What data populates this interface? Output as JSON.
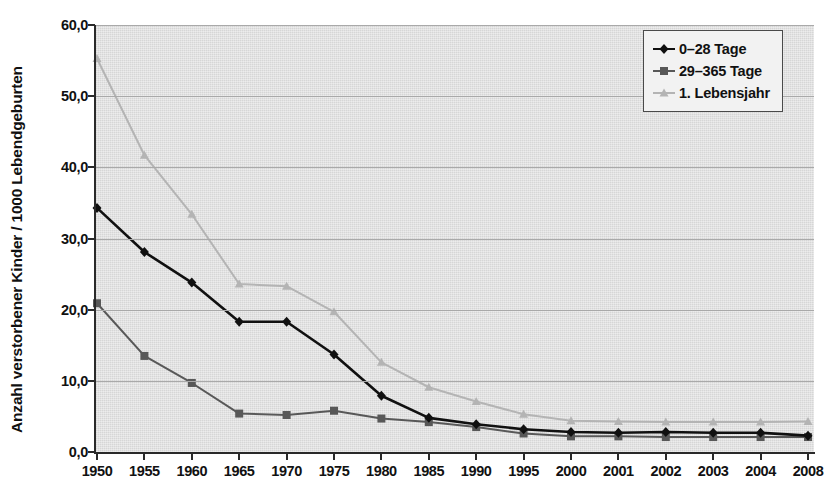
{
  "chart_data": {
    "type": "line",
    "title": "",
    "xlabel": "",
    "ylabel": "Anzahl verstorbener Kinder / 1000 Lebendgeburten",
    "categories": [
      "1950",
      "1955",
      "1960",
      "1965",
      "1970",
      "1975",
      "1980",
      "1985",
      "1990",
      "1995",
      "2000",
      "2001",
      "2002",
      "2003",
      "2004",
      "2008"
    ],
    "ylim": [
      0,
      60
    ],
    "ytick_labels": [
      "0,0",
      "10,0",
      "20,0",
      "30,0",
      "40,0",
      "50,0",
      "60,0"
    ],
    "ytick_values": [
      0,
      10,
      20,
      30,
      40,
      50,
      60
    ],
    "grid": true,
    "legend_position": "top-right",
    "series": [
      {
        "name": "0–28 Tage",
        "color": "#101010",
        "marker": "diamond",
        "values": [
          34.3,
          28.1,
          23.8,
          18.3,
          18.3,
          13.7,
          7.9,
          4.8,
          3.9,
          3.2,
          2.8,
          2.7,
          2.8,
          2.7,
          2.7,
          2.3
        ]
      },
      {
        "name": "29–365 Tage",
        "color": "#585858",
        "marker": "square",
        "values": [
          20.9,
          13.5,
          9.7,
          5.4,
          5.2,
          5.8,
          4.7,
          4.2,
          3.5,
          2.6,
          2.2,
          2.2,
          2.1,
          2.1,
          2.1,
          2.1
        ]
      },
      {
        "name": "1. Lebensjahr",
        "color": "#b4b4b4",
        "marker": "triangle",
        "values": [
          55.3,
          41.7,
          33.4,
          23.6,
          23.3,
          19.7,
          12.6,
          9.1,
          7.1,
          5.3,
          4.4,
          4.3,
          4.2,
          4.2,
          4.2,
          4.3
        ]
      }
    ]
  },
  "legend": {
    "items": [
      {
        "label": "0–28 Tage"
      },
      {
        "label": "29–365 Tage"
      },
      {
        "label": "1. Lebensjahr"
      }
    ]
  },
  "colors": {
    "series_1": "#101010",
    "series_2": "#585858",
    "series_3": "#b4b4b4",
    "plot_background": "#d6d6d6",
    "gridline": "#a9a9a9",
    "axis": "#2a2a2a",
    "legend_background": "#f2f2f2"
  }
}
